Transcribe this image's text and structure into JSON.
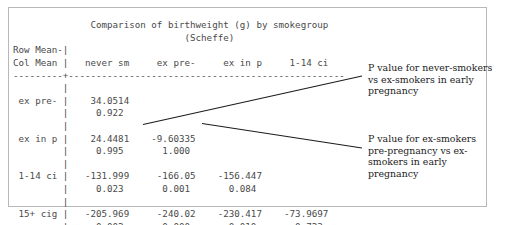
{
  "figure": {
    "title_line_1": "Comparison of birthweight (g) by smokegroup",
    "title_line_2": "(Scheffe)",
    "row_header_line_1": "Row Mean-",
    "row_header_line_2": "Col Mean",
    "separator": "---------+--------------------------------------------",
    "column_headers": [
      "never sm",
      "ex pre-",
      "ex in p",
      "1-14 ci"
    ],
    "row_labels": [
      "ex pre-",
      "ex in p",
      "1-14 ci",
      "15+ cig"
    ],
    "rows": [
      {
        "label": "ex pre-",
        "differences": [
          "34.0514"
        ],
        "p_values": [
          "0.922"
        ]
      },
      {
        "label": "ex in p",
        "differences": [
          "24.4481",
          "-9.60335"
        ],
        "p_values": [
          "0.995",
          "1.000"
        ]
      },
      {
        "label": "1-14 ci",
        "differences": [
          "-131.999",
          "-166.05",
          "-156.447"
        ],
        "p_values": [
          "0.023",
          "0.001",
          "0.084"
        ]
      },
      {
        "label": "15+ cig",
        "differences": [
          "-205.969",
          "-240.02",
          "-230.417",
          "-73.9697"
        ],
        "p_values": [
          "0.002",
          "0.000",
          "0.010",
          "0.723"
        ]
      }
    ],
    "output_text": "              Comparison of birthweight (g) by smokegroup\n                               (Scheffe)\nRow Mean-|\nCol Mean |   never sm     ex pre-     ex in p     1-14 ci\n---------+--------------------------------------------------\n         |\n ex pre- |    34.0514\n         |     0.922\n         |\n ex in p |    24.4481    -9.60335\n         |     0.995       1.000\n         |\n 1-14 ci |   -131.999     -166.05    -156.447\n         |     0.023       0.001       0.084\n         |\n 15+ cig |   -205.969     -240.02    -230.417    -73.9697\n         |     0.002       0.000       0.010       0.723"
  },
  "annotations": [
    {
      "id": "never-vs-expreg",
      "text": "P value for never-smokers vs ex-smokers in early pregnancy",
      "target_cell": "0.995"
    },
    {
      "id": "expre-vs-exinpreg",
      "text": "P value for ex-smokers pre-pregnancy vs ex-smokers in early pregnancy",
      "target_cell": "1.000"
    }
  ],
  "colors": {
    "text": "#4a4a4a",
    "annotation_text": "#1c1c1c",
    "frame": "#b8b8b8",
    "leader_line": "#1c1c1c",
    "background": "#ffffff"
  }
}
